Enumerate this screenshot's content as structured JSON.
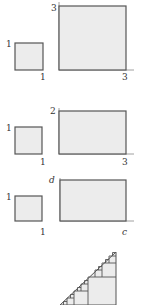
{
  "colors": {
    "fill": "#ececec",
    "stroke": "#555555",
    "label": "#333333"
  },
  "rows": [
    {
      "small": {
        "side_label": "1",
        "bottom_label": "1"
      },
      "large": {
        "side_label": "3",
        "bottom_label": "3"
      }
    },
    {
      "small": {
        "side_label": "1",
        "bottom_label": "1"
      },
      "large": {
        "side_label": "2",
        "bottom_label": "3"
      }
    },
    {
      "small": {
        "side_label": "1",
        "bottom_label": "1"
      },
      "large": {
        "side_label": "d",
        "bottom_label": "c"
      }
    }
  ],
  "triangle": {
    "description": "right triangle filled with nested squares along hypotenuse"
  }
}
